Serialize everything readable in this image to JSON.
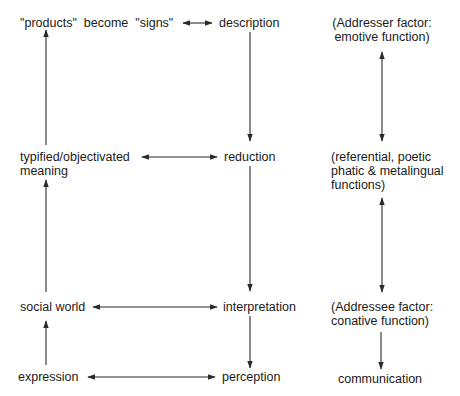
{
  "diagram": {
    "type": "flow-diagram",
    "colors": {
      "background": "#ffffff",
      "text": "#1a1a1a",
      "arrow": "#2a2a2a"
    },
    "left_column": {
      "products_signs": {
        "part1": "\"products\"",
        "part2": "become",
        "part3": "\"signs\""
      },
      "typified_meaning": {
        "line1": "typified/objectivated",
        "line2": "meaning"
      },
      "social_world": "social world",
      "expression": "expression"
    },
    "middle_column": {
      "description": "description",
      "reduction": "reduction",
      "interpretation": "interpretation",
      "perception": "perception"
    },
    "right_column": {
      "addresser": {
        "line1": "(Addresser factor:",
        "line2": "emotive function)"
      },
      "referential": {
        "line1": "(referential, poetic",
        "line2": "phatic & metalingual",
        "line3": "functions)"
      },
      "addressee": {
        "line1": "(Addressee factor:",
        "line2": "conative function)"
      },
      "communication": "communication"
    },
    "edges": [
      {
        "from": "expression",
        "to": "social_world",
        "type": "arrow-up"
      },
      {
        "from": "social_world",
        "to": "typified_meaning",
        "type": "arrow-up"
      },
      {
        "from": "typified_meaning",
        "to": "products_signs",
        "type": "arrow-up"
      },
      {
        "from": "description",
        "to": "reduction",
        "type": "arrow-down"
      },
      {
        "from": "reduction",
        "to": "interpretation",
        "type": "arrow-down"
      },
      {
        "from": "interpretation",
        "to": "perception",
        "type": "arrow-down"
      },
      {
        "from": "products_signs",
        "to": "description",
        "type": "bidirectional"
      },
      {
        "from": "typified_meaning",
        "to": "reduction",
        "type": "bidirectional"
      },
      {
        "from": "social_world",
        "to": "interpretation",
        "type": "bidirectional"
      },
      {
        "from": "expression",
        "to": "perception",
        "type": "bidirectional"
      },
      {
        "from": "addresser",
        "to": "referential",
        "type": "bidirectional"
      },
      {
        "from": "referential",
        "to": "addressee",
        "type": "bidirectional"
      },
      {
        "from": "addressee",
        "to": "communication",
        "type": "arrow-down"
      }
    ]
  }
}
